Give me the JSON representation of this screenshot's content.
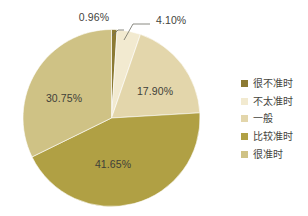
{
  "chart_data": {
    "type": "pie",
    "title": "",
    "subtitle": "",
    "xlabel": "",
    "ylabel": "",
    "grid": false,
    "legend_position": "right",
    "start_angle_deg": 0,
    "direction": "clockwise",
    "categories": [
      "很不准时",
      "不太准时",
      "一般",
      "比较准时",
      "很准时"
    ],
    "values": [
      0.96,
      4.1,
      17.9,
      41.65,
      30.75
    ],
    "value_labels": [
      "0.96%",
      "4.10%",
      "17.90%",
      "41.65%",
      "30.75%"
    ],
    "colors": [
      "#8c7a33",
      "#f2ead0",
      "#e3d6ab",
      "#b0a044",
      "#cfc285"
    ],
    "slices": [
      {
        "label": "很不准时",
        "value": 0.96,
        "display": "0.96%",
        "color": "#8c7a33",
        "label_placement": "outside-callout"
      },
      {
        "label": "不太准时",
        "value": 4.1,
        "display": "4.10%",
        "color": "#f2ead0",
        "label_placement": "outside-callout"
      },
      {
        "label": "一般",
        "value": 17.9,
        "display": "17.90%",
        "color": "#e3d6ab",
        "label_placement": "inside"
      },
      {
        "label": "比较准时",
        "value": 41.65,
        "display": "41.65%",
        "color": "#b0a044",
        "label_placement": "inside"
      },
      {
        "label": "很准时",
        "value": 30.75,
        "display": "30.75%",
        "color": "#cfc285",
        "label_placement": "inside"
      }
    ]
  },
  "labels": {
    "callout_small": "0.96%",
    "callout_second": "4.10%",
    "inside_third": "17.90%",
    "inside_fourth": "41.65%",
    "inside_fifth": "30.75%"
  },
  "legend": {
    "items": [
      {
        "label": "很不准时",
        "color": "#8c7a33"
      },
      {
        "label": "不太准时",
        "color": "#f2ead0"
      },
      {
        "label": "一般",
        "color": "#e3d6ab"
      },
      {
        "label": "比较准时",
        "color": "#b0a044"
      },
      {
        "label": "很准时",
        "color": "#cfc285"
      }
    ]
  },
  "style": {
    "background": "#ffffff",
    "text_color": "#45453e",
    "leader_color": "#6d6d63"
  }
}
